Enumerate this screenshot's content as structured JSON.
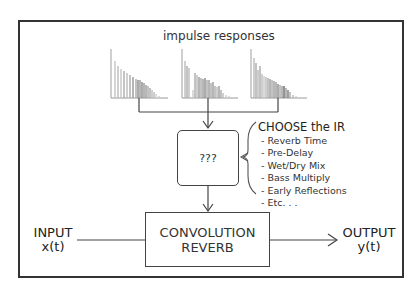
{
  "diagram": {
    "title": "impulse responses",
    "choose": {
      "heading": "CHOOSE the IR",
      "items": [
        "- Reverb Time",
        "- Pre-Delay",
        "- Wet/Dry Mix",
        "- Bass Multiply",
        "- Early Reflections",
        "- Etc. . ."
      ]
    },
    "selector_box": "???",
    "convolution_box": {
      "line1": "CONVOLUTION",
      "line2": "REVERB"
    },
    "input": {
      "label": "INPUT",
      "signal": "x(t)"
    },
    "output": {
      "label": "OUTPUT",
      "signal": "y(t)"
    },
    "impulse_response_count": 3,
    "colors": {
      "line": "#444444",
      "frame": "#333333",
      "bar_light": "#bdbdbd",
      "bar_dark": "#8a8a8a"
    }
  }
}
